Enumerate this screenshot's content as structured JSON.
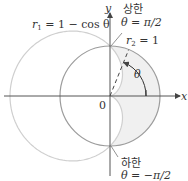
{
  "diagram": {
    "axes": {
      "x_label": "x",
      "y_label": "y",
      "origin_label": "0"
    },
    "curves": [
      {
        "name": "cardioid",
        "label_lhs": "r",
        "label_sub": "1",
        "label_rhs": " = 1 − cos θ",
        "color": "#c8c8c8"
      },
      {
        "name": "circle",
        "label_lhs": "r",
        "label_sub": "2",
        "label_rhs": " = 1",
        "color": "#9a9a9a"
      }
    ],
    "angle_label": "θ",
    "upper_limit": {
      "title": "상한",
      "expr": "θ = π/2"
    },
    "lower_limit": {
      "title": "하한",
      "expr": "θ = −π/2"
    },
    "colors": {
      "axis": "#555555",
      "shade": "#f0f0f0",
      "cardioid": "#c8c8c8",
      "circle": "#9a9a9a",
      "ray": "#444444"
    }
  }
}
